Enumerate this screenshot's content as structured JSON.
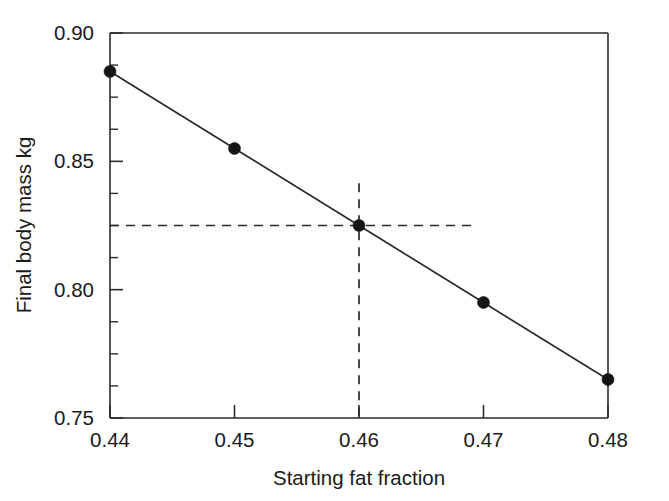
{
  "chart_data": {
    "type": "line",
    "title": "",
    "subtitle": "",
    "xlabel": "Starting fat fraction",
    "ylabel": "Final body mass kg",
    "x": [
      0.44,
      0.45,
      0.46,
      0.47,
      0.48
    ],
    "values": [
      0.885,
      0.855,
      0.825,
      0.795,
      0.765
    ],
    "series": [
      {
        "name": "Final body mass",
        "x": [
          0.44,
          0.45,
          0.46,
          0.47,
          0.48
        ],
        "values": [
          0.885,
          0.855,
          0.825,
          0.795,
          0.765
        ]
      }
    ],
    "xlim": [
      0.44,
      0.48
    ],
    "ylim": [
      0.75,
      0.9
    ],
    "x_ticks": [
      0.44,
      0.45,
      0.46,
      0.47,
      0.48
    ],
    "x_tick_labels": [
      "0.44",
      "0.45",
      "0.46",
      "0.47",
      "0.48"
    ],
    "y_ticks": [
      0.75,
      0.8,
      0.85,
      0.9
    ],
    "y_tick_labels": [
      "0.75",
      "0.80",
      "0.85",
      "0.90"
    ],
    "y_minor_tick_step": 0.0125,
    "grid": false,
    "legend": false,
    "legend_position": "none",
    "marker": "filled-circle",
    "line_color": "#2b2b2b",
    "marker_color": "#151515",
    "background_color": "#ffffff",
    "annotations": [
      {
        "type": "crosshair-guide",
        "style": "dashed",
        "x": 0.46,
        "y": 0.825,
        "horizontal_from_x": 0.44,
        "horizontal_to_x": 0.4695,
        "vertical_from_y": 0.8415,
        "vertical_to_y": 0.75,
        "color": "#2b2b2b"
      }
    ]
  },
  "axis_titles": {
    "x": "Starting fat fraction",
    "y": "Final body mass kg"
  }
}
